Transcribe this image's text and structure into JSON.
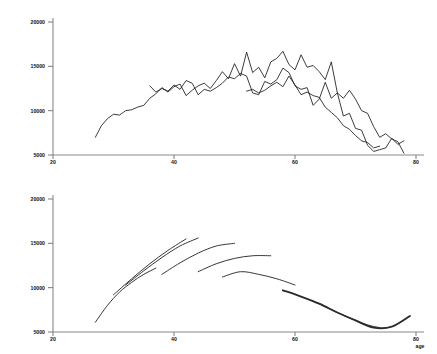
{
  "figure": {
    "background": "#ffffff",
    "ink_color": "#1a1a1a",
    "axis_color": "#8a8a8a"
  },
  "chart_data": [
    {
      "type": "line",
      "panel": "top",
      "title": "",
      "subtitle": "",
      "xlabel": "",
      "ylabel": "",
      "xlim": [
        20,
        80
      ],
      "ylim": [
        5000,
        20000
      ],
      "grid": false,
      "legend": "none",
      "xticks": [
        20,
        40,
        60,
        80
      ],
      "yticks": [
        5000,
        10000,
        15000,
        20000
      ],
      "xtick_labels": [
        "20",
        "40",
        "60",
        "80"
      ],
      "ytick_labels": [
        "5000",
        "10000",
        "15000",
        "20000"
      ],
      "description": "Overlapping jagged cross-sectional age profiles rising from about 7000 at age 27 to a plateau near 15000-16500 between ages 40 and 58, then falling to about 5500-7000 by age 78.",
      "series": [
        {
          "name": "series-1",
          "x": [
            27.0,
            28.0,
            29.0,
            30.0,
            31.0,
            32.0,
            33.0,
            34.0,
            35.0,
            36.0,
            37.0,
            38.0,
            39.0,
            40.0,
            41.0,
            42.0,
            43.0,
            44.0,
            45.0,
            46.0,
            47.0,
            48.0,
            49.0,
            50.0,
            51.0,
            52.0,
            53.0,
            54.0,
            55.0,
            56.0,
            57.0,
            58.0,
            59.0,
            60.0,
            61.0,
            62.0,
            63.0,
            64.0,
            65.0,
            66.0,
            67.0,
            68.0,
            69.0,
            70.0,
            71.0,
            72.0,
            73.0,
            74.0,
            75.0,
            76.0,
            77.0,
            78.0
          ],
          "values": [
            7000,
            8300,
            9100,
            9600,
            9500,
            10000,
            10100,
            10400,
            10600,
            11400,
            11900,
            12600,
            12100,
            12700,
            13000,
            11700,
            12300,
            12800,
            13100,
            12500,
            13400,
            14400,
            13600,
            15300,
            13900,
            16600,
            14300,
            14900,
            13700,
            15500,
            15900,
            16700,
            15200,
            14600,
            16300,
            14900,
            15100,
            14400,
            13500,
            15500,
            12000,
            11400,
            12300,
            11300,
            10000,
            9700,
            8200,
            7000,
            7400,
            6800,
            6500,
            5200
          ]
        },
        {
          "name": "series-2",
          "x": [
            36.0,
            37.0,
            38.0,
            39.0,
            40.0,
            41.0,
            42.0,
            43.0,
            44.0,
            45.0,
            46.0,
            47.0,
            48.0,
            49.0,
            50.0,
            51.0,
            52.0,
            53.0,
            54.0,
            55.0,
            56.0,
            57.0,
            58.0,
            59.0,
            60.0,
            61.0,
            62.0,
            63.0,
            64.0,
            65.0,
            66.0,
            67.0,
            68.0,
            69.0,
            70.0,
            71.0,
            72.0,
            73.0,
            74.0,
            75.0,
            76.0,
            77.0,
            78.0
          ],
          "values": [
            12800,
            12100,
            12500,
            12200,
            12900,
            12400,
            13400,
            13100,
            11800,
            12400,
            12200,
            12600,
            13100,
            13800,
            13600,
            14200,
            13900,
            12000,
            11800,
            13300,
            13000,
            13500,
            14800,
            14300,
            12800,
            12400,
            12600,
            10600,
            11300,
            13200,
            11400,
            12000,
            9400,
            9700,
            8000,
            7800,
            6100,
            5400,
            5600,
            5800,
            6900,
            6200,
            6600
          ]
        },
        {
          "name": "series-3",
          "x": [
            52.0,
            53.0,
            54.0,
            55.0,
            56.0,
            57.0,
            58.0,
            59.0,
            60.0,
            61.0,
            62.0,
            63.0,
            64.0,
            65.0,
            66.0,
            67.0,
            68.0,
            69.0,
            70.0,
            71.0,
            72.0,
            73.0,
            74.0
          ],
          "values": [
            12200,
            12400,
            12000,
            12300,
            12800,
            13200,
            12700,
            13900,
            12900,
            11800,
            12100,
            11700,
            11500,
            10400,
            9800,
            9200,
            8300,
            7900,
            7200,
            6600,
            6400,
            5800,
            6000
          ]
        }
      ]
    },
    {
      "type": "line",
      "panel": "bottom",
      "title": "",
      "subtitle": "",
      "xlabel": "age",
      "ylabel": "",
      "xlim": [
        20,
        80
      ],
      "ylim": [
        5000,
        20000
      ],
      "grid": false,
      "legend": "none",
      "xticks": [
        20,
        40,
        60,
        80
      ],
      "yticks": [
        5000,
        10000,
        15000,
        20000
      ],
      "xtick_labels": [
        "20",
        "40",
        "60",
        "80"
      ],
      "ytick_labels": [
        "5000",
        "10000",
        "15000",
        "20000"
      ],
      "description": "Smoothed overlapping cohort arcs. Earlier cohorts start low at young ages and rise steeply to 13000-16000; later cohorts are flatter and peak earlier; the final long cohort declines from about 9700 at age 58 to a minimum near 5400 at age 74 before turning up to about 6800 at age 79.",
      "series": [
        {
          "name": "cohort-1",
          "thick": false,
          "x": [
            27.0,
            29.0,
            31.0,
            33.0,
            35.0,
            37.0
          ],
          "values": [
            6100,
            8000,
            9500,
            10600,
            11500,
            12200
          ]
        },
        {
          "name": "cohort-2",
          "thick": false,
          "x": [
            30.0,
            33.0,
            36.0,
            39.0,
            42.0
          ],
          "values": [
            9200,
            11000,
            12700,
            14200,
            15500
          ]
        },
        {
          "name": "cohort-3",
          "thick": false,
          "x": [
            32.0,
            35.0,
            38.0,
            41.0,
            44.0
          ],
          "values": [
            10300,
            11900,
            13400,
            14700,
            15600
          ]
        },
        {
          "name": "cohort-4",
          "thick": false,
          "x": [
            38.0,
            41.0,
            44.0,
            47.0,
            50.0
          ],
          "values": [
            11500,
            12800,
            13900,
            14700,
            15000
          ]
        },
        {
          "name": "cohort-5",
          "thick": false,
          "x": [
            44.0,
            47.0,
            50.0,
            53.0,
            56.0
          ],
          "values": [
            11800,
            12700,
            13300,
            13600,
            13600
          ]
        },
        {
          "name": "cohort-6",
          "thick": false,
          "x": [
            48.0,
            51.0,
            54.0,
            57.0,
            60.0
          ],
          "values": [
            11200,
            11800,
            11500,
            11000,
            10300
          ]
        },
        {
          "name": "cohort-7",
          "thick": true,
          "x": [
            58.0,
            61.0,
            64.0,
            67.0,
            70.0,
            73.0,
            76.0,
            79.0
          ],
          "values": [
            9700,
            9000,
            8200,
            7200,
            6300,
            5500,
            5600,
            6800
          ]
        },
        {
          "name": "cohort-8",
          "thick": false,
          "x": [
            63.0,
            66.0,
            69.0,
            72.0,
            74.0
          ],
          "values": [
            8500,
            7500,
            6600,
            5800,
            5500
          ]
        }
      ]
    }
  ]
}
